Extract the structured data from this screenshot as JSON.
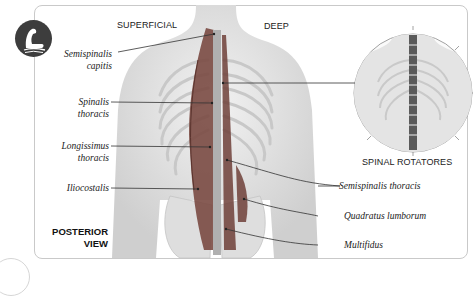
{
  "headings": {
    "superficial": "SUPERFICIAL",
    "deep": "DEEP",
    "inset": "SPINAL ROTATORES",
    "view_line1": "POSTERIOR",
    "view_line2": "VIEW"
  },
  "labels_left": [
    {
      "line1": "Semispinalis",
      "line2": "capitis"
    },
    {
      "line1": "Spinalis",
      "line2": "thoracis"
    },
    {
      "line1": "Longissimus",
      "line2": "thoracis"
    },
    {
      "line1": "Iliocostalis",
      "line2": ""
    }
  ],
  "labels_right": [
    {
      "text": "Semispinalis thoracis"
    },
    {
      "text": "Quadratus lumborum"
    },
    {
      "text": "Multifidus"
    }
  ],
  "logo": {
    "icon": "flexed-arm-icon"
  },
  "colors": {
    "muscle": "#7a4a42",
    "bone": "#d8d8d8",
    "skin": "#e6e6e6",
    "logo": "#3d3d3d"
  }
}
